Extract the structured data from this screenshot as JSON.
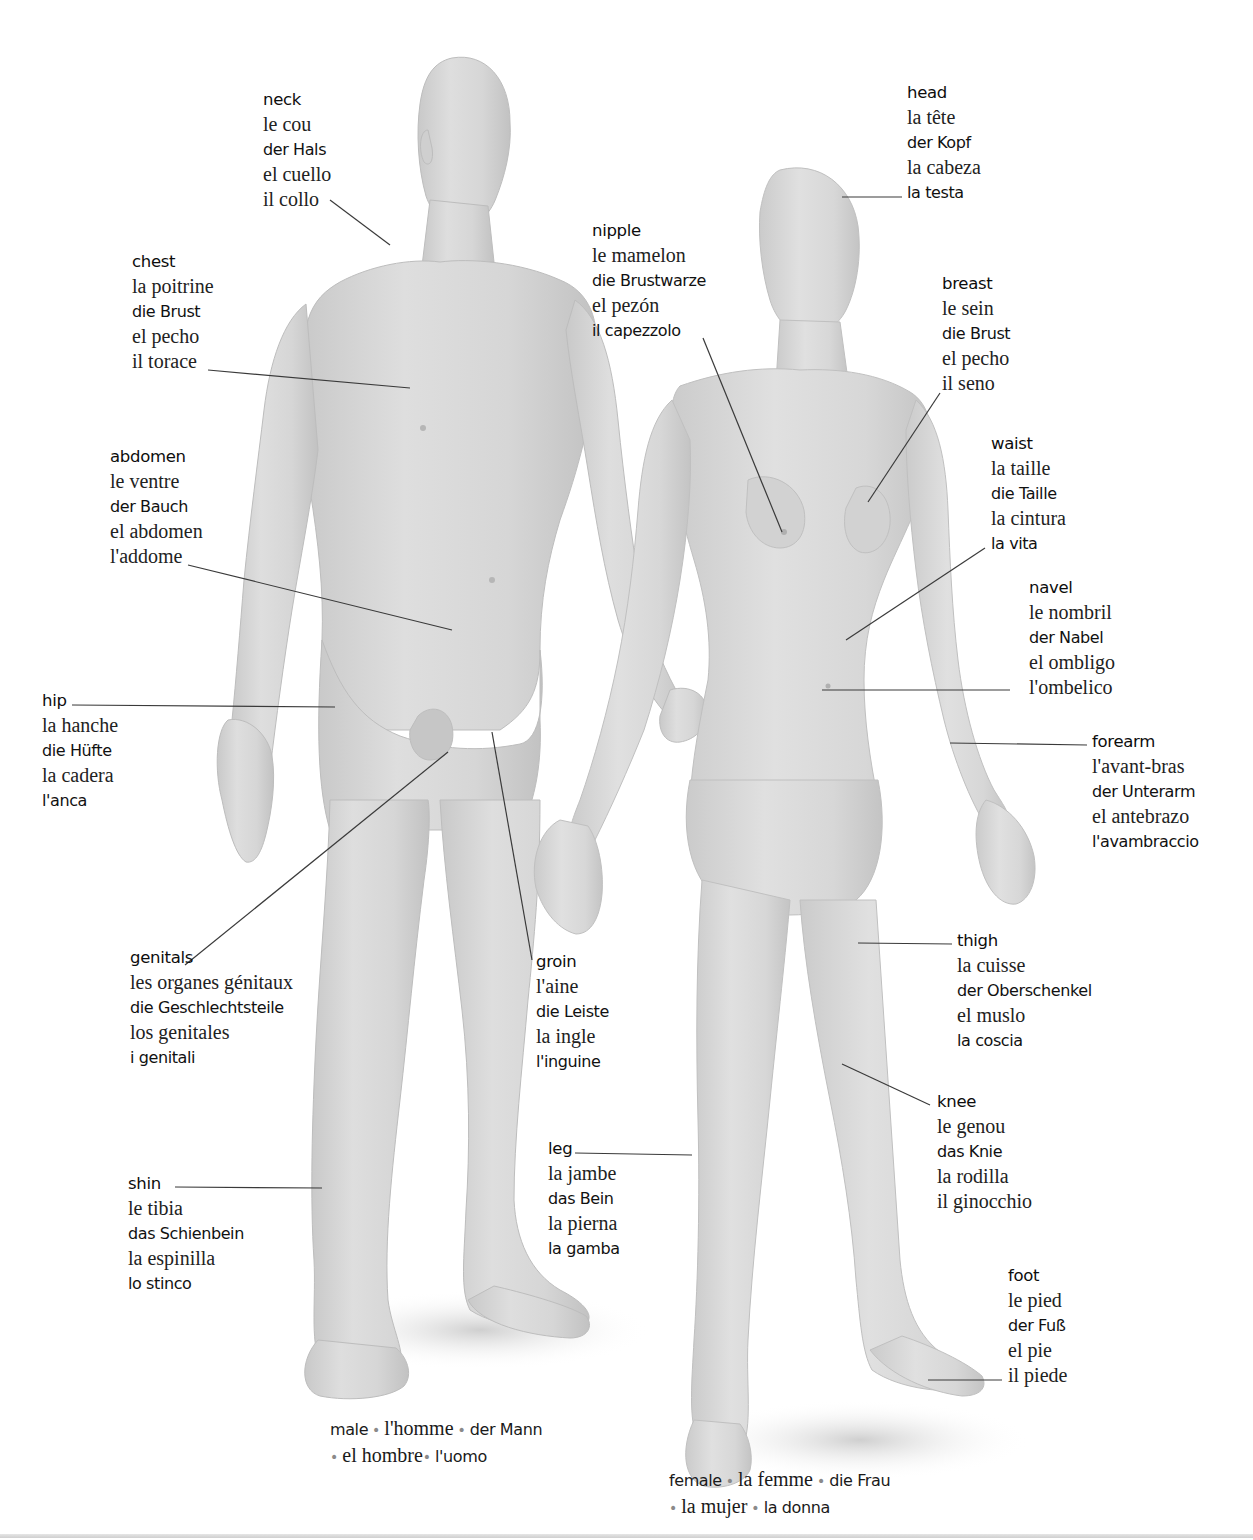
{
  "page": {
    "figures": {
      "male": {
        "name": "male-figure",
        "skin_color": "#d8d8d8",
        "shadow_color": "#b9b9b9"
      },
      "female": {
        "name": "female-figure",
        "skin_color": "#dadada",
        "shadow_color": "#bcbcbc"
      }
    },
    "leader_line_color": "#3a3a3a"
  },
  "labels": {
    "neck": {
      "en": "neck",
      "fr": "le cou",
      "de": "der Hals",
      "es": "el cuello",
      "it": "il collo",
      "it_style": "serif"
    },
    "chest": {
      "en": "chest",
      "fr": "la poitrine",
      "de": "die Brust",
      "es": "el pecho",
      "it": "il torace",
      "it_style": "serif"
    },
    "abdomen": {
      "en": "abdomen",
      "fr": "le ventre",
      "de": "der Bauch",
      "es": "el abdomen",
      "it": "l'addome",
      "it_style": "serif"
    },
    "hip": {
      "en": "hip",
      "fr": "la hanche",
      "de": "die Hüfte",
      "es": "la cadera",
      "it": "l'anca",
      "it_style": "sans"
    },
    "genitals": {
      "en": "genitals",
      "fr": "les organes génitaux",
      "de": "die Geschlechtsteile",
      "es": "los genitales",
      "it": "i genitali",
      "it_style": "sans"
    },
    "groin": {
      "en": "groin",
      "fr": "l'aine",
      "de": "die Leiste",
      "es": "la ingle",
      "it": "l'inguine",
      "it_style": "sans"
    },
    "shin": {
      "en": "shin",
      "fr": "le tibia",
      "de": "das Schienbein",
      "es": "la espinilla",
      "it": "lo stinco",
      "it_style": "sans"
    },
    "leg": {
      "en": "leg",
      "fr": "la jambe",
      "de": "das Bein",
      "es": "la pierna",
      "it": "la gamba",
      "it_style": "sans"
    },
    "nipple": {
      "en": "nipple",
      "fr": "le mamelon",
      "de": "die Brustwarze",
      "es": "el pezón",
      "it": "il capezzolo",
      "it_style": "sans"
    },
    "head": {
      "en": "head",
      "fr": "la tête",
      "de": "der Kopf",
      "es": "la cabeza",
      "it": "la testa",
      "it_style": "sans"
    },
    "breast": {
      "en": "breast",
      "fr": "le sein",
      "de": "die Brust",
      "es": "el pecho",
      "it": "il seno",
      "it_style": "serif"
    },
    "waist": {
      "en": "waist",
      "fr": "la taille",
      "de": "die Taille",
      "es": "la cintura",
      "it": "la vita",
      "it_style": "sans"
    },
    "navel": {
      "en": "navel",
      "fr": "le nombril",
      "de": "der Nabel",
      "es": "el ombligo",
      "it": "l'ombelico",
      "it_style": "serif"
    },
    "forearm": {
      "en": "forearm",
      "fr": "l'avant-bras",
      "de": "der Unterarm",
      "es": "el antebrazo",
      "it": "l'avambraccio",
      "it_style": "sans"
    },
    "thigh": {
      "en": "thigh",
      "fr": "la cuisse",
      "de": "der Oberschenkel",
      "es": "el muslo",
      "it": "la coscia",
      "it_style": "sans"
    },
    "knee": {
      "en": "knee",
      "fr": "le genou",
      "de": "das Knie",
      "es": "la rodilla",
      "it": "il ginocchio",
      "it_style": "serif"
    },
    "foot": {
      "en": "foot",
      "fr": "le pied",
      "de": "der Fuß",
      "es": "el pie",
      "it": "il piede",
      "it_style": "serif"
    }
  },
  "captions": {
    "male": {
      "en": "male",
      "fr": "l'homme",
      "de": "der Mann",
      "es": "el hombre",
      "it": "l'uomo",
      "separator": "•"
    },
    "female": {
      "en": "female",
      "fr": "la femme",
      "de": "die Frau",
      "es": "la mujer",
      "it": "la donna",
      "separator": "•"
    }
  }
}
